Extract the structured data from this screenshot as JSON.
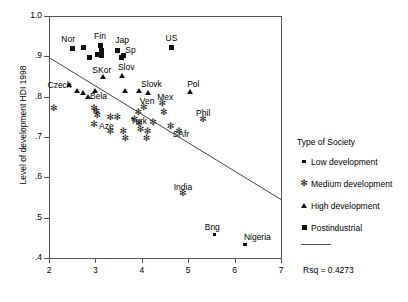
{
  "chart_data": {
    "type": "scatter",
    "title": "",
    "xlabel": "",
    "ylabel": "Level of development HDI 1998",
    "xlim": [
      2,
      7
    ],
    "ylim": [
      0.4,
      1.0
    ],
    "xticks": [
      2,
      3,
      4,
      5,
      6,
      7
    ],
    "xticklabels": [
      "2",
      "3",
      "4",
      "5",
      "6",
      "7"
    ],
    "yticks": [
      0.4,
      0.5,
      0.6,
      0.7,
      0.8,
      0.9,
      1.0
    ],
    "yticklabels": [
      ".4",
      ".5",
      ".6",
      ".7",
      ".8",
      ".9",
      "1.0"
    ],
    "grid": false,
    "legend_position": "right",
    "annotations": [
      "Rsq = 0.4273"
    ],
    "regression_line": {
      "x": [
        2,
        7
      ],
      "y": [
        0.897,
        0.545
      ]
    },
    "series": [
      {
        "name": "Low development",
        "marker": "small-square",
        "points": [
          {
            "label": "Bng",
            "x": 5.55,
            "y": 0.461
          },
          {
            "label": "Nigeria",
            "x": 6.2,
            "y": 0.436
          }
        ]
      },
      {
        "name": "Medium development",
        "marker": "asterisk",
        "points": [
          {
            "label": "",
            "x": 2.08,
            "y": 0.772
          },
          {
            "label": "",
            "x": 2.95,
            "y": 0.772
          },
          {
            "label": "",
            "x": 3.0,
            "y": 0.766
          },
          {
            "label": "",
            "x": 3.02,
            "y": 0.757
          },
          {
            "label": "",
            "x": 3.3,
            "y": 0.752
          },
          {
            "label": "",
            "x": 3.45,
            "y": 0.752
          },
          {
            "label": "Aze",
            "x": 2.95,
            "y": 0.734
          },
          {
            "label": "",
            "x": 3.3,
            "y": 0.716
          },
          {
            "label": "",
            "x": 3.58,
            "y": 0.716
          },
          {
            "label": "",
            "x": 3.62,
            "y": 0.698
          },
          {
            "label": "Turk",
            "x": 3.82,
            "y": 0.745
          },
          {
            "label": "",
            "x": 3.9,
            "y": 0.763
          },
          {
            "label": "",
            "x": 3.92,
            "y": 0.735
          },
          {
            "label": "",
            "x": 3.95,
            "y": 0.72
          },
          {
            "label": "",
            "x": 4.1,
            "y": 0.716
          },
          {
            "label": "",
            "x": 4.08,
            "y": 0.698
          },
          {
            "label": "Ven",
            "x": 4.02,
            "y": 0.775
          },
          {
            "label": "",
            "x": 4.22,
            "y": 0.738
          },
          {
            "label": "Mex",
            "x": 4.42,
            "y": 0.785
          },
          {
            "label": "",
            "x": 4.45,
            "y": 0.763
          },
          {
            "label": "SAfr",
            "x": 4.6,
            "y": 0.728
          },
          {
            "label": "",
            "x": 4.78,
            "y": 0.716
          },
          {
            "label": "Phil",
            "x": 5.3,
            "y": 0.745
          },
          {
            "label": "India",
            "x": 4.86,
            "y": 0.562
          }
        ]
      },
      {
        "name": "High development",
        "marker": "triangle",
        "points": [
          {
            "label": "Czech",
            "x": 2.42,
            "y": 0.833
          },
          {
            "label": "",
            "x": 2.58,
            "y": 0.818
          },
          {
            "label": "",
            "x": 2.72,
            "y": 0.812
          },
          {
            "label": "Bela",
            "x": 2.82,
            "y": 0.801
          },
          {
            "label": "",
            "x": 2.98,
            "y": 0.818
          },
          {
            "label": "SKor",
            "x": 3.15,
            "y": 0.852
          },
          {
            "label": "Slov",
            "x": 3.55,
            "y": 0.855
          },
          {
            "label": "",
            "x": 3.62,
            "y": 0.818
          },
          {
            "label": "Slovk",
            "x": 3.92,
            "y": 0.818
          },
          {
            "label": "",
            "x": 4.12,
            "y": 0.812
          },
          {
            "label": "Pol",
            "x": 5.02,
            "y": 0.815
          }
        ]
      },
      {
        "name": "Postindustrial",
        "marker": "large-square",
        "points": [
          {
            "label": "Nor",
            "x": 2.48,
            "y": 0.922
          },
          {
            "label": "",
            "x": 2.72,
            "y": 0.925
          },
          {
            "label": "",
            "x": 2.85,
            "y": 0.9
          },
          {
            "label": "Fin",
            "x": 3.08,
            "y": 0.93
          },
          {
            "label": "",
            "x": 3.1,
            "y": 0.918
          },
          {
            "label": "",
            "x": 3.12,
            "y": 0.905
          },
          {
            "label": "",
            "x": 3.02,
            "y": 0.908
          },
          {
            "label": "Jap",
            "x": 3.45,
            "y": 0.918
          },
          {
            "label": "Sp",
            "x": 3.58,
            "y": 0.905
          },
          {
            "label": "",
            "x": 3.55,
            "y": 0.9
          },
          {
            "label": "US",
            "x": 4.62,
            "y": 0.925
          }
        ]
      }
    ]
  },
  "legend": {
    "title": "Type of Society",
    "items": [
      {
        "symbol": "small-square",
        "label": "Low development"
      },
      {
        "symbol": "asterisk",
        "label": "Medium development"
      },
      {
        "symbol": "triangle",
        "label": "High development"
      },
      {
        "symbol": "large-square",
        "label": "Postindustrial"
      }
    ]
  },
  "stats": {
    "rsq_label": "Rsq = 0.4273"
  },
  "colors": {
    "marker": "#111111",
    "axis": "#555555",
    "background": "#ffffff"
  }
}
